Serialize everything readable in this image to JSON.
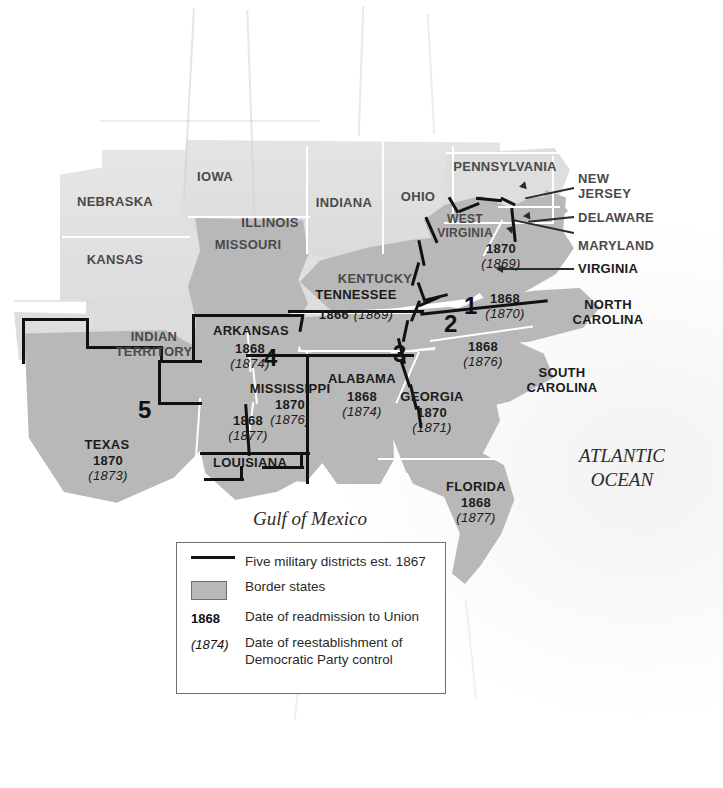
{
  "map": {
    "title": "Reconstruction: Five Military Districts and Readmission Dates",
    "water_labels": [
      {
        "name": "gulf-of-mexico",
        "text": "Gulf of Mexico"
      },
      {
        "name": "atlantic-ocean",
        "line1": "ATLANTIC",
        "line2": "OCEAN"
      }
    ],
    "colors": {
      "reconstruction_fill": "#b8b8b8",
      "border_state_fill": "#b8b8b8",
      "union_fill": "#dcdcdc",
      "district_boundary": "#111111",
      "state_boundary": "#ffffff",
      "ocean": "#fafafa"
    },
    "districts": [
      {
        "number": "1",
        "states": "Virginia"
      },
      {
        "number": "2",
        "states": "North Carolina, South Carolina"
      },
      {
        "number": "3",
        "states": "Alabama, Florida, Georgia"
      },
      {
        "number": "4",
        "states": "Arkansas, Mississippi"
      },
      {
        "number": "5",
        "states": "Louisiana, Texas"
      }
    ],
    "reconstruction_states": [
      {
        "name": "virginia",
        "label": "VIRGINIA",
        "readmitted": "1870",
        "democratic": "(1869)"
      },
      {
        "name": "north-carolina",
        "label": "NORTH CAROLINA",
        "readmitted": "1868",
        "democratic": "(1870)"
      },
      {
        "name": "south-carolina",
        "label": "SOUTH CAROLINA",
        "readmitted": "1868",
        "democratic": "(1876)"
      },
      {
        "name": "georgia",
        "label": "GEORGIA",
        "readmitted": "1870",
        "democratic": "(1871)"
      },
      {
        "name": "florida",
        "label": "FLORIDA",
        "readmitted": "1868",
        "democratic": "(1877)"
      },
      {
        "name": "alabama",
        "label": "ALABAMA",
        "readmitted": "1868",
        "democratic": "(1874)"
      },
      {
        "name": "mississippi",
        "label": "MISSISSIPPI",
        "readmitted": "1870",
        "democratic": "(1876)"
      },
      {
        "name": "louisiana",
        "label": "LOUISIANA",
        "readmitted": "1868",
        "democratic": "(1877)"
      },
      {
        "name": "arkansas",
        "label": "ARKANSAS",
        "readmitted": "1868",
        "democratic": "(1874)"
      },
      {
        "name": "texas",
        "label": "TEXAS",
        "readmitted": "1870",
        "democratic": "(1873)"
      },
      {
        "name": "tennessee",
        "label": "TENNESSEE",
        "readmitted": "1866",
        "democratic": "(1869)"
      }
    ],
    "border_states": [
      {
        "name": "missouri",
        "label": "MISSOURI"
      },
      {
        "name": "kentucky",
        "label": "KENTUCKY"
      },
      {
        "name": "west-virginia",
        "label": "WEST VIRGINIA"
      },
      {
        "name": "maryland",
        "label": "MARYLAND"
      },
      {
        "name": "delaware",
        "label": "DELAWARE"
      }
    ],
    "other_labels": [
      {
        "name": "nebraska",
        "label": "NEBRASKA"
      },
      {
        "name": "kansas",
        "label": "KANSAS"
      },
      {
        "name": "iowa",
        "label": "IOWA"
      },
      {
        "name": "illinois",
        "label": "ILLINOIS"
      },
      {
        "name": "indiana",
        "label": "INDIANA"
      },
      {
        "name": "ohio",
        "label": "OHIO"
      },
      {
        "name": "pennsylvania",
        "label": "PENNSYLVANIA"
      },
      {
        "name": "new-jersey",
        "label": "NEW JERSEY"
      },
      {
        "name": "indian-territory",
        "label": "INDIAN TERRITORY"
      }
    ],
    "label_text": {
      "nebraska": "NEBRASKA",
      "kansas": "KANSAS",
      "iowa": "IOWA",
      "illinois": "ILLINOIS",
      "indiana": "INDIANA",
      "ohio": "OHIO",
      "pennsylvania": "PENNSYLVANIA",
      "new_jersey_l1": "NEW",
      "new_jersey_l2": "JERSEY",
      "delaware": "DELAWARE",
      "maryland": "MARYLAND",
      "virginia": "VIRGINIA",
      "west_virginia_l1": "WEST",
      "west_virginia_l2": "VIRGINIA",
      "missouri": "MISSOURI",
      "kentucky": "KENTUCKY",
      "tennessee": "TENNESSEE",
      "tennessee_dates": "1866 (1869)",
      "north_carolina_l1": "NORTH",
      "north_carolina_l2": "CAROLINA",
      "south_carolina_l1": "SOUTH",
      "south_carolina_l2": "CAROLINA",
      "georgia": "GEORGIA",
      "florida": "FLORIDA",
      "alabama": "ALABAMA",
      "mississippi": "MISSISSIPPI",
      "louisiana": "LOUISIANA",
      "arkansas": "ARKANSAS",
      "texas": "TEXAS",
      "indian_territory_l1": "INDIAN",
      "indian_territory_l2": "TERRITORY"
    },
    "dates": {
      "virginia_r": "1870",
      "virginia_d": "(1869)",
      "nc_r": "1868",
      "nc_d": "(1870)",
      "sc_r": "1868",
      "sc_d": "(1876)",
      "georgia_r": "1870",
      "georgia_d": "(1871)",
      "florida_r": "1868",
      "florida_d": "(1877)",
      "alabama_r": "1868",
      "alabama_d": "(1874)",
      "mississippi_r": "1870",
      "mississippi_d": "(1876)",
      "louisiana_r": "1868",
      "louisiana_d": "(1877)",
      "arkansas_r": "1868",
      "arkansas_d": "(1874)",
      "texas_r": "1870",
      "texas_d": "(1873)"
    },
    "district_numbers": {
      "d1": "1",
      "d2": "2",
      "d3": "3",
      "d4": "4",
      "d5": "5"
    }
  },
  "legend": {
    "rows": [
      {
        "name": "military-districts",
        "key": "line",
        "text": "Five military districts est. 1867"
      },
      {
        "name": "border-states",
        "key": "swatch",
        "text": "Border states"
      },
      {
        "name": "readmission-date",
        "key": "1868",
        "text": "Date of readmission to Union"
      },
      {
        "name": "democratic-control",
        "key": "(1874)",
        "text_l1": "Date of reestablishment of",
        "text_l2": "Democratic Party control"
      }
    ],
    "military_districts_text": "Five military districts est. 1867",
    "border_states_text": "Border states",
    "readmission_key": "1868",
    "readmission_text": "Date of readmission to Union",
    "democratic_key": "(1874)",
    "democratic_text_l1": "Date of reestablishment of",
    "democratic_text_l2": "Democratic Party control"
  }
}
